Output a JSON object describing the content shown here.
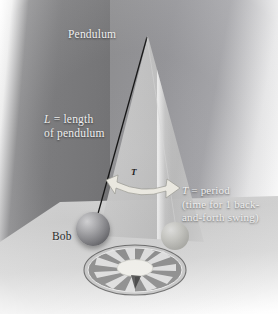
{
  "figure": {
    "labels": {
      "pendulum": "Pendulum",
      "length_line1": "L",
      "length_line1_rest": " = length",
      "length_line2": "of pendulum",
      "period_line1": "T",
      "period_line1_rest": " = period",
      "period_line2": "(time for 1 back-",
      "period_line3": "and-forth swing)",
      "bob": "Bob",
      "arrow_symbol": "T"
    }
  },
  "colors": {
    "wall": "#8e8e90",
    "wall_left": "#76767a",
    "floor": "#d6d6d6",
    "cone": "#c6c6c6",
    "bob_main": "#7e7e82",
    "bob_ghost": "#c2c2bd",
    "string": "#1a1a1a",
    "arrow_fill": "#eceae2",
    "label_light": "#f3f3f3",
    "label_dark": "#1e1e1e",
    "background": "#ffffff"
  },
  "geometry": {
    "pivot": {
      "x": 147,
      "y": 38
    },
    "bob_main_center": {
      "x": 93,
      "y": 229
    },
    "bob_ghost_center": {
      "x": 175,
      "y": 236
    },
    "disc_center": {
      "x": 135,
      "y": 270
    },
    "cone_apex": {
      "x": 148,
      "y": 36
    }
  }
}
